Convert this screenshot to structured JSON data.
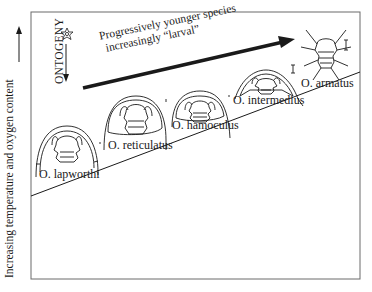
{
  "figure": {
    "y_axis_label": "Increasing temperature and oxygen content",
    "ontogeny_label": "ONTOGENY",
    "trend_label": {
      "line1": "Progressively younger species",
      "line2": "increasingly “larval”"
    },
    "icons": {
      "larva_star": "larva-star-icon",
      "ontogeny_arrow": "down-arrow-icon",
      "y_axis_arrow": "up-arrow-icon",
      "trend_arrow": "diagonal-arrow-icon"
    },
    "species": [
      {
        "name": "O. lapworthi",
        "order": 1
      },
      {
        "name": "O. reticulatus",
        "order": 2
      },
      {
        "name": "O. hamoculus",
        "order": 3
      },
      {
        "name": "O. intermedius",
        "order": 4
      },
      {
        "name": "O. armatus",
        "order": 5
      }
    ],
    "colors": {
      "line": "#1a1a1a",
      "frame": "#555555",
      "background": "#ffffff"
    }
  }
}
